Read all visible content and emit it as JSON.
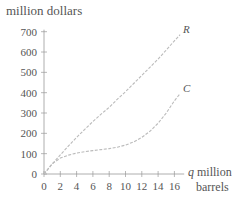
{
  "chart_data": {
    "type": "line",
    "title": "",
    "ylabel": "million dollars",
    "xlabel_var": "q",
    "xlabel": "million barrels",
    "xlim": [
      0,
      17
    ],
    "ylim": [
      0,
      700
    ],
    "grid": false,
    "legend": "inline curve labels",
    "x_ticks": [
      0,
      2,
      4,
      6,
      8,
      10,
      12,
      14,
      16
    ],
    "y_ticks": [
      0,
      100,
      200,
      300,
      400,
      500,
      600,
      700
    ],
    "x": [
      0,
      1,
      2,
      3,
      4,
      5,
      6,
      7,
      8,
      9,
      10,
      11,
      12,
      13,
      14,
      15,
      16,
      16.7
    ],
    "series": [
      {
        "name": "R",
        "values": [
          0,
          48,
          94,
          138,
          180,
          220,
          258,
          294,
          328,
          368,
          405,
          445,
          485,
          525,
          565,
          610,
          655,
          685
        ]
      },
      {
        "name": "C",
        "values": [
          0,
          50,
          78,
          93,
          103,
          110,
          115,
          120,
          125,
          132,
          142,
          158,
          180,
          210,
          250,
          300,
          360,
          395
        ]
      }
    ]
  },
  "labels": {
    "y_axis_title": "million dollars",
    "x_axis_var": "q",
    "x_axis_line1": "million",
    "x_axis_line2": "barrels"
  }
}
